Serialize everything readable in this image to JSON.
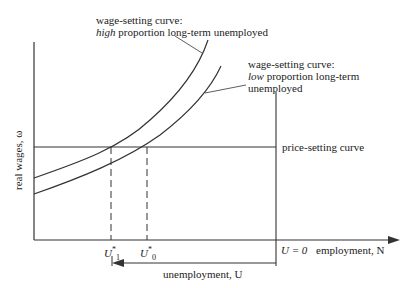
{
  "diagram": {
    "title": "",
    "y_axis_label": "real wages, ω",
    "x_axis_label": "employment, N",
    "u_zero_label": "U = 0",
    "unemployment_label": "unemployment, U",
    "price_setting_label": "price-setting curve",
    "ws_high": {
      "line1": "wage-setting curve:",
      "line2_emph": "high",
      "line2_rest": " proportion long-term unemployed"
    },
    "ws_low": {
      "line1": "wage-setting curve:",
      "line2_emph": "low",
      "line2_rest": " proportion long-term",
      "line3": "unemployed"
    },
    "u1_label": "U",
    "u1_sub": "1",
    "u0_label": "U",
    "u0_sub": "0",
    "star": "*"
  }
}
